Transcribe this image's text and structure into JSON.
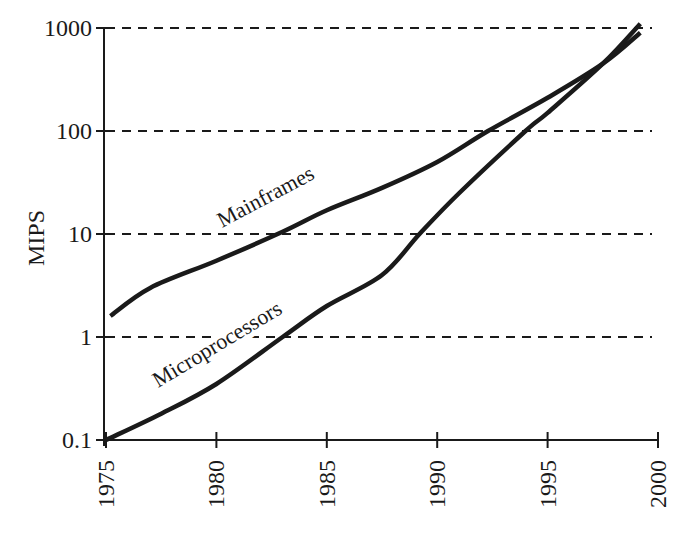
{
  "chart_data": {
    "type": "line",
    "title": "",
    "xlabel": "",
    "ylabel": "MIPS",
    "yscale": "log",
    "xlim": [
      1975,
      2000
    ],
    "ylim": [
      0.1,
      1000
    ],
    "x_ticks": [
      1975,
      1980,
      1985,
      1990,
      1995,
      2000
    ],
    "x_tick_labels": [
      "1975",
      "1980",
      "1985",
      "1990",
      "1995",
      "2000"
    ],
    "y_ticks": [
      0.1,
      1,
      10,
      100,
      1000
    ],
    "y_tick_labels": [
      "0.1",
      "1",
      "10",
      "100",
      "1000"
    ],
    "grid": {
      "horizontal": true,
      "vertical": false,
      "style": "dashed"
    },
    "legend": "inline labels along curves",
    "series": [
      {
        "name": "Mainframes",
        "x": [
          1975.2,
          1977,
          1980,
          1983,
          1985,
          1987.5,
          1990,
          1992.3,
          1995,
          1997.5,
          1999.2
        ],
        "values": [
          1.6,
          3.0,
          5.5,
          10.5,
          17,
          28,
          50,
          100,
          210,
          450,
          900
        ]
      },
      {
        "name": "Microprocessors",
        "x": [
          1975,
          1977.5,
          1980,
          1983,
          1985,
          1987.5,
          1989.2,
          1991,
          1994,
          1995,
          1997.5,
          1999.2
        ],
        "values": [
          0.1,
          0.18,
          0.35,
          1.0,
          2.0,
          4.0,
          10,
          25,
          100,
          150,
          450,
          1100
        ]
      }
    ]
  },
  "axis": {
    "ylabel": "MIPS",
    "yticks": [
      "1000",
      "100",
      "10",
      "1",
      "0.1"
    ],
    "xticks": [
      "1975",
      "1980",
      "1985",
      "1990",
      "1995",
      "2000"
    ]
  },
  "labels": {
    "mainframes": "Mainframes",
    "microprocessors": "Microprocessors"
  },
  "colors": {
    "ink": "#1a1a1a",
    "background": "#ffffff"
  }
}
